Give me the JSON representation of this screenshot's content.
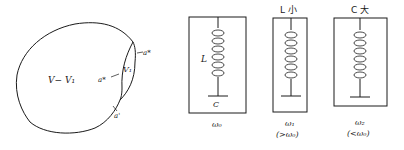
{
  "figure_left": {
    "region_outer": "V− V₁",
    "region_inner": "V₁",
    "boundary_labels": [
      "a*",
      "a*",
      "a'"
    ]
  },
  "figure_right": {
    "circuits": [
      {
        "top_label": "",
        "inductor_label": "L",
        "capacitor_label": "C",
        "freq_label": "ω₀",
        "freq_note": ""
      },
      {
        "top_label": "L 小",
        "inductor_label": "",
        "capacitor_label": "",
        "freq_label": "ω₁",
        "freq_note": "(>ω₀)"
      },
      {
        "top_label": "C 大",
        "inductor_label": "",
        "capacitor_label": "",
        "freq_label": "ω₂",
        "freq_note": "(<ω₀)"
      }
    ]
  },
  "colors": {
    "ink": "#1a1a1a",
    "background": "#ffffff"
  }
}
